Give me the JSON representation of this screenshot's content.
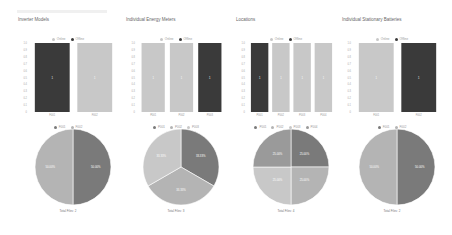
{
  "header": {
    "title": ""
  },
  "colors": {
    "online": "#c8c8c8",
    "offline": "#3a3a3a",
    "pie": [
      "#7a7a7a",
      "#b4b4b4",
      "#c8c8c8",
      "#9a9a9a"
    ]
  },
  "legend": {
    "online": "Online",
    "offline": "Offline"
  },
  "footer_note": "",
  "chart_data": [
    {
      "type": "bar",
      "title": "Inverter Models",
      "categories": [
        "F001",
        "F002"
      ],
      "series": [
        {
          "name": "Offline",
          "values": [
            1,
            0
          ]
        },
        {
          "name": "Online",
          "values": [
            0,
            1
          ]
        }
      ],
      "bar_labels": [
        "1",
        "1"
      ],
      "ylim": [
        0,
        1
      ],
      "yticks": [
        "0",
        "0.1",
        "0.2",
        "0.3",
        "0.4",
        "0.5",
        "0.6",
        "0.7",
        "0.8",
        "0.9",
        "1.0"
      ],
      "pie": {
        "legend": [
          "F001",
          "F002"
        ],
        "values": [
          50,
          50
        ],
        "labels": [
          "50.00%",
          "50.00%"
        ],
        "footer": "Total Files: 2"
      }
    },
    {
      "type": "bar",
      "title": "Individual Energy Meters",
      "categories": [
        "P001",
        "P002",
        "P003"
      ],
      "series": [
        {
          "name": "Offline",
          "values": [
            0,
            0,
            1
          ]
        },
        {
          "name": "Online",
          "values": [
            1,
            1,
            0
          ]
        }
      ],
      "bar_labels": [
        "1",
        "1",
        "1"
      ],
      "ylim": [
        0,
        1
      ],
      "yticks": [
        "0",
        "0.1",
        "0.2",
        "0.3",
        "0.4",
        "0.5",
        "0.6",
        "0.7",
        "0.8",
        "0.9",
        "1.0"
      ],
      "pie": {
        "legend": [
          "P001",
          "P002",
          "P003"
        ],
        "values": [
          33.33,
          33.33,
          33.33
        ],
        "labels": [
          "33.33%",
          "33.33%",
          "33.33%"
        ],
        "footer": "Total Files: 3"
      }
    },
    {
      "type": "bar",
      "title": "Locations",
      "categories": [
        "P001",
        "P002",
        "P003",
        "P004"
      ],
      "series": [
        {
          "name": "Offline",
          "values": [
            1,
            0,
            0,
            0
          ]
        },
        {
          "name": "Online",
          "values": [
            0,
            1,
            1,
            1
          ]
        }
      ],
      "bar_labels": [
        "1",
        "1",
        "1",
        "1"
      ],
      "ylim": [
        0,
        1
      ],
      "yticks": [
        "0",
        "0.1",
        "0.2",
        "0.3",
        "0.4",
        "0.5",
        "0.6",
        "0.7",
        "0.8",
        "0.9",
        "1.0"
      ],
      "pie": {
        "legend": [
          "P001",
          "P002",
          "P003",
          "P004"
        ],
        "values": [
          25,
          25,
          25,
          25
        ],
        "labels": [
          "25.00%",
          "25.00%",
          "25.00%",
          "25.00%"
        ],
        "footer": "Total Files: 4"
      }
    },
    {
      "type": "bar",
      "title": "Individual Stationary Batteries",
      "categories": [
        "F001",
        "F002"
      ],
      "series": [
        {
          "name": "Offline",
          "values": [
            0,
            1
          ]
        },
        {
          "name": "Online",
          "values": [
            1,
            0
          ]
        }
      ],
      "bar_labels": [
        "1",
        "1"
      ],
      "ylim": [
        0,
        1
      ],
      "yticks": [
        "0",
        "0.1",
        "0.2",
        "0.3",
        "0.4",
        "0.5",
        "0.6",
        "0.7",
        "0.8",
        "0.9",
        "1.0"
      ],
      "pie": {
        "legend": [
          "F001",
          "F002"
        ],
        "values": [
          50,
          50
        ],
        "labels": [
          "50.00%",
          "50.00%"
        ],
        "footer": "Total Files: 2"
      }
    }
  ]
}
